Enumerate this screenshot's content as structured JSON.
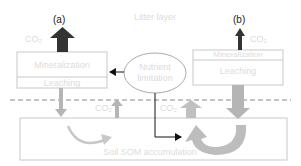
{
  "title": "Litter layer",
  "panels": {
    "a": {
      "label": "(a)",
      "co2": "CO₂",
      "mineralization": "Mineralization",
      "leaching": "Leaching"
    },
    "b": {
      "label": "(b)",
      "co2": "CO₂",
      "mineralization": "Mineralization",
      "leaching": "Leaching"
    }
  },
  "center": {
    "ellipse_line1": "Nutrient",
    "ellipse_line2": "limitation"
  },
  "soil": {
    "co2_left": "CO₂",
    "co2_right": "CO₂",
    "label": "Soil SOM accumulation"
  },
  "colors": {
    "dark_arrow": "#333333",
    "grey_arrow": "#b5b5b5",
    "box_border": "#c8c8c8",
    "dashed": "#888888",
    "faint_text": "#dcdcdc"
  }
}
